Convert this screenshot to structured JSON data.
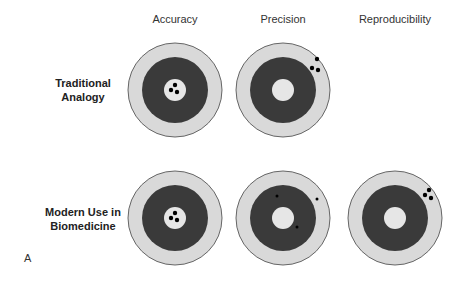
{
  "columns": [
    {
      "label": "Accuracy",
      "cx": 175
    },
    {
      "label": "Precision",
      "cx": 283
    },
    {
      "label": "Reproducibility",
      "cx": 395
    }
  ],
  "rows": [
    {
      "label_line1": "Traditional",
      "label_line2": "Analogy",
      "cy": 90
    },
    {
      "label_line1": "Modern Use in",
      "label_line2": "Biomedicine",
      "cy": 218
    }
  ],
  "panel_label": "A",
  "colors": {
    "outer_ring": "#d9d9d9",
    "dark_ring": "#3a3a3a",
    "bullseye": "#e6e6e6",
    "outline": "#666666",
    "dot": "#000000"
  },
  "target_geometry": {
    "outer_r": 47,
    "dark_r": 33,
    "inner_r": 11
  },
  "targets": [
    {
      "row": 0,
      "col": 0,
      "visible": true,
      "dots": [
        {
          "dx": 0,
          "dy": -5,
          "r": 2.2
        },
        {
          "dx": -4,
          "dy": 0,
          "r": 2.2
        },
        {
          "dx": 2,
          "dy": 2,
          "r": 2.2
        }
      ]
    },
    {
      "row": 0,
      "col": 1,
      "visible": true,
      "dots": [
        {
          "dx": 34,
          "dy": -31,
          "r": 2.2
        },
        {
          "dx": 29,
          "dy": -22,
          "r": 2.2
        },
        {
          "dx": 35,
          "dy": -20,
          "r": 2.2
        }
      ]
    },
    {
      "row": 0,
      "col": 2,
      "visible": false,
      "dots": []
    },
    {
      "row": 1,
      "col": 0,
      "visible": true,
      "dots": [
        {
          "dx": 0,
          "dy": -5,
          "r": 2.2
        },
        {
          "dx": -4,
          "dy": 0,
          "r": 2.2
        },
        {
          "dx": 2,
          "dy": 2,
          "r": 2.2
        }
      ]
    },
    {
      "row": 1,
      "col": 1,
      "visible": true,
      "dots": [
        {
          "dx": -6,
          "dy": -22,
          "r": 1.5
        },
        {
          "dx": 34,
          "dy": -19,
          "r": 1.5
        },
        {
          "dx": 14,
          "dy": 9,
          "r": 1.5
        }
      ]
    },
    {
      "row": 1,
      "col": 2,
      "visible": true,
      "dots": [
        {
          "dx": 34,
          "dy": -28,
          "r": 2.2
        },
        {
          "dx": 30,
          "dy": -23,
          "r": 2.2
        },
        {
          "dx": 36,
          "dy": -20,
          "r": 2.2
        }
      ]
    }
  ]
}
